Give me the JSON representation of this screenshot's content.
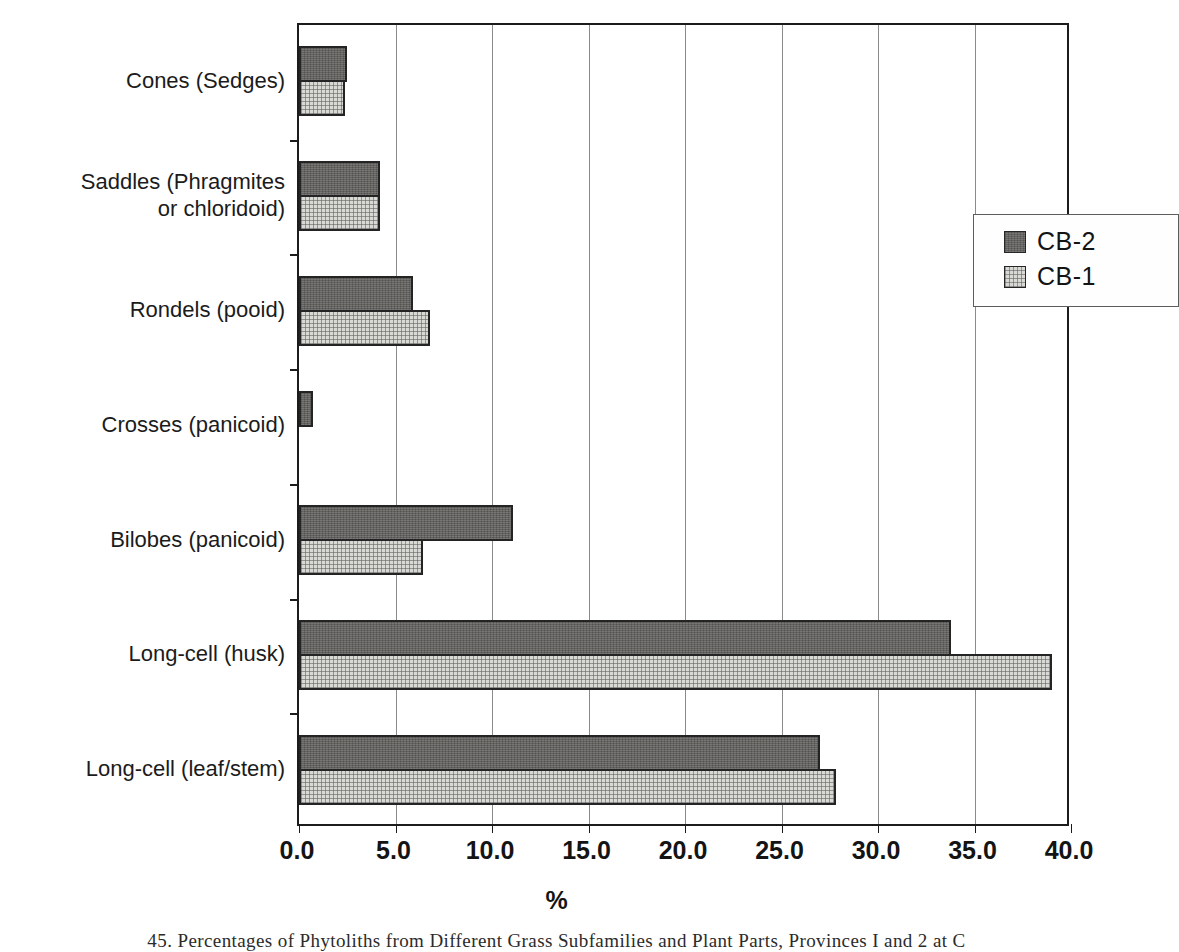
{
  "chart_data": {
    "type": "bar",
    "orientation": "horizontal",
    "title": "",
    "xlabel": "%",
    "ylabel": "",
    "xlim": [
      0.0,
      40.0
    ],
    "xticks": [
      "0.0",
      "5.0",
      "10.0",
      "15.0",
      "20.0",
      "25.0",
      "30.0",
      "35.0",
      "40.0"
    ],
    "grid": "vertical",
    "legend_position": "inside-upper-right",
    "categories": [
      "Cones (Sedges)",
      "Saddles (Phragmites\nor chloridoid)",
      "Rondels (pooid)",
      "Crosses (panicoid)",
      "Bilobes (panicoid)",
      "Long-cell (husk)",
      "Long-cell (leaf/stem)"
    ],
    "series": [
      {
        "name": "CB-2",
        "color": "#63625f",
        "values": [
          2.5,
          4.2,
          5.9,
          0.7,
          11.1,
          33.8,
          27.0
        ]
      },
      {
        "name": "CB-1",
        "color": "#d8d8d4",
        "values": [
          2.4,
          4.2,
          6.8,
          0.0,
          6.4,
          39.0,
          27.8
        ]
      }
    ]
  },
  "axis": {
    "x_title": "%",
    "tick_labels": [
      "0.0",
      "5.0",
      "10.0",
      "15.0",
      "20.0",
      "25.0",
      "30.0",
      "35.0",
      "40.0"
    ]
  },
  "legend": {
    "items": [
      {
        "label": "CB-2",
        "swatch": "cb2"
      },
      {
        "label": "CB-1",
        "swatch": "cb1"
      }
    ]
  },
  "caption": {
    "text": "45. Percentages of Phytoliths from Different Grass Subfamilies and Plant Parts, Provinces I and 2 at C"
  }
}
